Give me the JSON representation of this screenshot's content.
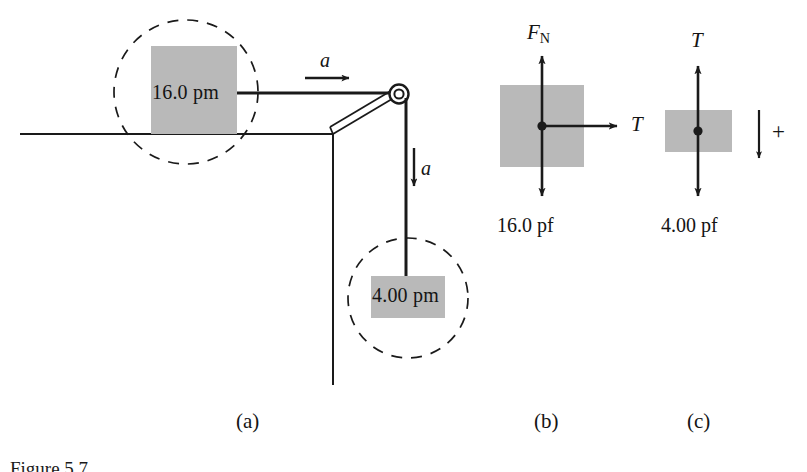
{
  "figure": {
    "caption_partial": "Figure 5.7",
    "panels": [
      {
        "id": "a",
        "label": "(a)"
      },
      {
        "id": "b",
        "label": "(b)"
      },
      {
        "id": "c",
        "label": "(c)"
      }
    ]
  },
  "panel_a": {
    "name": "pulley-system-diagram",
    "table_block_label": "16.0 pm",
    "hanging_block_label": "4.00 pm",
    "accel_horizontal_label": "a",
    "accel_vertical_label": "a",
    "elements": {
      "pulley": "pulley-wheel",
      "bracket": "pulley-bracket",
      "cord": "connecting-cord",
      "table": "table-surface",
      "highlight_circles": "dashed-detail-circle"
    }
  },
  "panel_b": {
    "name": "free-body-diagram-block-on-table",
    "normal_force_label": "F",
    "normal_force_subscript": "N",
    "tension_label": "T",
    "weight_label": "16.0 pf"
  },
  "panel_c": {
    "name": "free-body-diagram-hanging-block",
    "tension_label": "T",
    "weight_label": "4.00 pf",
    "positive_direction_label": "+",
    "positive_direction_sense": "down"
  },
  "colors": {
    "block_gray": "#b9b9b9",
    "line_black": "#1a1a1a",
    "background": "#ffffff"
  }
}
